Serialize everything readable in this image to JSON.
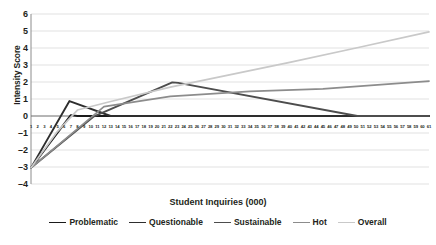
{
  "chart_data": {
    "type": "line",
    "title": "",
    "xlabel": "Student Inquiries (000)",
    "ylabel": "Intensity Score",
    "xlim": [
      1,
      61
    ],
    "ylim": [
      -4,
      6
    ],
    "yticks": [
      6,
      5,
      4,
      3,
      2,
      1,
      0,
      -1,
      -2,
      -3,
      -4
    ],
    "grid": true,
    "legend_position": "bottom",
    "x": [
      1,
      2,
      3,
      4,
      5,
      6,
      7,
      8,
      9,
      10,
      11,
      12,
      13,
      14,
      15,
      16,
      17,
      18,
      19,
      20,
      21,
      22,
      23,
      24,
      25,
      26,
      27,
      28,
      29,
      30,
      31,
      32,
      33,
      34,
      35,
      36,
      37,
      38,
      39,
      40,
      41,
      42,
      43,
      44,
      45,
      46,
      47,
      48,
      49,
      50,
      51,
      52,
      53,
      54,
      55,
      56,
      57,
      58,
      59,
      60,
      61
    ],
    "xtick_labels": [
      "1",
      "2",
      "3",
      "4",
      "5",
      "6",
      "7",
      "8",
      "9",
      "10",
      "11",
      "12",
      "13",
      "14",
      "15",
      "16",
      "17",
      "18",
      "19",
      "20",
      "21",
      "22",
      "23",
      "24",
      "25",
      "26",
      "27",
      "28",
      "29",
      "30",
      "31",
      "32",
      "33",
      "34",
      "35",
      "36",
      "37",
      "38",
      "39",
      "40",
      "41",
      "42",
      "43",
      "44",
      "45",
      "46",
      "47",
      "48",
      "49",
      "50",
      "51",
      "52",
      "53",
      "54",
      "55",
      "56",
      "57",
      "58",
      "59",
      "60",
      "61"
    ],
    "series": [
      {
        "name": "Problematic",
        "color": "#1a1a1a",
        "width": 1.9,
        "points": [
          [
            1,
            -3.05
          ],
          [
            7,
            0.05
          ],
          [
            8,
            0.0
          ],
          [
            61,
            0.0
          ]
        ]
      },
      {
        "name": "Questionable",
        "color": "#2e2e2e",
        "width": 1.9,
        "points": [
          [
            1,
            -3.05
          ],
          [
            6.8,
            0.88
          ],
          [
            13,
            0.0
          ],
          [
            61,
            0.0
          ]
        ]
      },
      {
        "name": "Sustainable",
        "color": "#4d4d4d",
        "width": 1.9,
        "points": [
          [
            1,
            -3.05
          ],
          [
            10.5,
            -0.02
          ],
          [
            22.3,
            1.98
          ],
          [
            23.2,
            1.95
          ],
          [
            50.2,
            0.0
          ],
          [
            61,
            0.0
          ]
        ]
      },
      {
        "name": "Hot",
        "color": "#8c8c8c",
        "width": 1.7,
        "points": [
          [
            1,
            -3.05
          ],
          [
            12,
            0.55
          ],
          [
            22,
            1.15
          ],
          [
            34,
            1.45
          ],
          [
            45,
            1.6
          ],
          [
            61,
            2.05
          ]
        ]
      },
      {
        "name": "Overall",
        "color": "#c9c9c9",
        "width": 1.7,
        "points": [
          [
            1,
            -3.05
          ],
          [
            5,
            -0.9
          ],
          [
            8,
            0.35
          ],
          [
            13,
            0.85
          ],
          [
            22,
            1.7
          ],
          [
            30,
            2.35
          ],
          [
            40,
            3.15
          ],
          [
            50,
            4.0
          ],
          [
            61,
            4.95
          ]
        ]
      }
    ]
  }
}
